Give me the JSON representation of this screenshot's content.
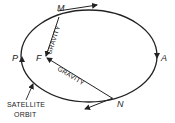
{
  "diagram": {
    "points": {
      "M": "M",
      "F": "F",
      "P": "P",
      "A": "A",
      "N": "N"
    },
    "forces": {
      "gravity_top": "GRAVITY",
      "gravity_bottom": "GRAVITY"
    },
    "caption": {
      "line1": "SATELLITE",
      "line2": "ORBIT"
    },
    "colors": {
      "stroke": "#222222",
      "background": "#ffffff"
    }
  }
}
